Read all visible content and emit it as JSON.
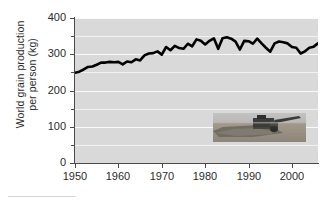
{
  "chart_data": {
    "type": "line",
    "title": "",
    "xlabel": "",
    "ylabel": "World grain production\nper person (kg)",
    "ylabel_line1": "World grain production",
    "ylabel_line2": "per person (kg)",
    "xlim": [
      1950,
      2006
    ],
    "ylim": [
      0,
      400
    ],
    "ytick_labels": [
      "0",
      "100",
      "200",
      "300",
      "400"
    ],
    "ytick_values": [
      0,
      100,
      200,
      300,
      400
    ],
    "yminor_values": [
      50,
      150,
      250,
      350
    ],
    "xtick_labels": [
      "1950",
      "1960",
      "1970",
      "1980",
      "1990",
      "2000"
    ],
    "xtick_values": [
      1950,
      1960,
      1970,
      1980,
      1990,
      2000
    ],
    "grid": "horizontal-white-on-gray",
    "legend": "none",
    "line_color": "#000000",
    "plot_background": "#d9d9d9",
    "series": [
      {
        "name": "World grain production per person (kg)",
        "x": [
          1950,
          1951,
          1952,
          1953,
          1954,
          1955,
          1956,
          1957,
          1958,
          1959,
          1960,
          1961,
          1962,
          1963,
          1964,
          1965,
          1966,
          1967,
          1968,
          1969,
          1970,
          1971,
          1972,
          1973,
          1974,
          1975,
          1976,
          1977,
          1978,
          1979,
          1980,
          1981,
          1982,
          1983,
          1984,
          1985,
          1986,
          1987,
          1988,
          1989,
          1990,
          1991,
          1992,
          1993,
          1994,
          1995,
          1996,
          1997,
          1998,
          1999,
          2000,
          2001,
          2002,
          2003,
          2004,
          2005,
          2006
        ],
        "values": [
          249,
          252,
          258,
          265,
          266,
          271,
          277,
          277,
          279,
          278,
          279,
          272,
          280,
          278,
          286,
          283,
          297,
          302,
          303,
          308,
          299,
          320,
          311,
          323,
          317,
          315,
          329,
          322,
          341,
          337,
          327,
          337,
          344,
          315,
          344,
          347,
          343,
          335,
          313,
          337,
          336,
          329,
          343,
          330,
          318,
          307,
          330,
          335,
          333,
          330,
          320,
          318,
          302,
          308,
          318,
          321,
          330
        ]
      }
    ],
    "annotations": [
      {
        "name": "combine-harvester-photo",
        "description": "Photograph of a combine harvester cutting a field of grain",
        "x_range": [
          1982,
          2004
        ],
        "y_range": [
          95,
          160
        ]
      }
    ]
  },
  "photo": {
    "alt": "combine harvester in grain field",
    "sky_color": "#b4b4b4",
    "field_color": "#9a9288",
    "crop_color": "#7f7a70",
    "machine_color": "#3a3a3a"
  }
}
